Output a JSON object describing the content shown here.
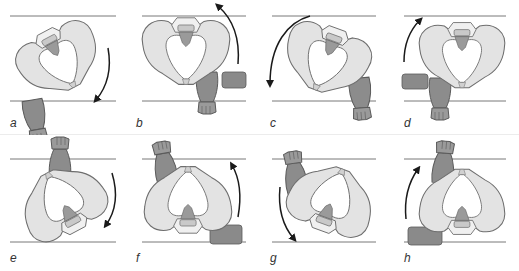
{
  "figure": {
    "colors": {
      "bone_fill": "#e3e3e3",
      "bone_outline": "#6e6e6e",
      "leg_fill": "#8c8c8c",
      "sacrum_fill": "#9a9a9a",
      "block_fill": "#8a8a8a",
      "guide_line": "#555555",
      "arrow": "#1a1a1a",
      "label": "#333333"
    },
    "panels": [
      {
        "label": "a",
        "arrow_direction": "clockwise-down",
        "block": false,
        "leg": "bottom"
      },
      {
        "label": "b",
        "arrow_direction": "counterclockwise-up",
        "block": "right",
        "leg": "bottom"
      },
      {
        "label": "c",
        "arrow_direction": "counterclockwise-down",
        "block": false,
        "leg": "bottom-right"
      },
      {
        "label": "d",
        "arrow_direction": "clockwise-up",
        "block": "left",
        "leg": "bottom"
      },
      {
        "label": "e",
        "arrow_direction": "clockwise-down",
        "block": false,
        "leg": "top"
      },
      {
        "label": "f",
        "arrow_direction": "counterclockwise-up",
        "block": "right",
        "leg": "top"
      },
      {
        "label": "g",
        "arrow_direction": "counterclockwise-down",
        "block": false,
        "leg": "top-left"
      },
      {
        "label": "h",
        "arrow_direction": "clockwise-up",
        "block": "left",
        "leg": "top"
      }
    ]
  }
}
